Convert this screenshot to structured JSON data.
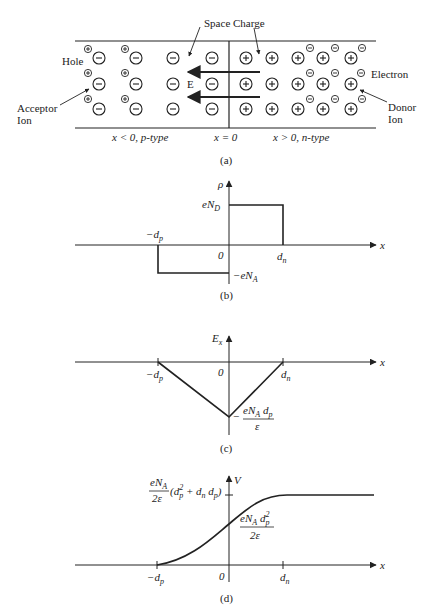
{
  "panel_a": {
    "annotations": {
      "space_charge": "Space Charge",
      "hole": "Hole",
      "electron": "Electron",
      "acceptor_ion": [
        "Acceptor",
        "Ion"
      ],
      "donor_ion": [
        "Donor",
        "Ion"
      ],
      "field": "E"
    },
    "region_labels": {
      "p_side": "x < 0, p-type",
      "junction": "x = 0",
      "n_side": "x > 0, n-type"
    },
    "caption": "(a)"
  },
  "panel_b": {
    "ylabel": "ρ",
    "xlabel": "x",
    "origin": "0",
    "left_tick": "−d",
    "left_tick_sub": "p",
    "right_tick": "d",
    "right_tick_sub": "n",
    "top_level": "eN",
    "top_level_sub": "D",
    "bottom_level": "−eN",
    "bottom_level_sub": "A",
    "caption": "(b)"
  },
  "panel_c": {
    "ylabel": "E",
    "ylabel_sub": "x",
    "xlabel": "x",
    "origin": "0",
    "left_tick": "−d",
    "left_tick_sub": "p",
    "right_tick": "d",
    "right_tick_sub": "n",
    "min_label_prefix": "−",
    "min_label_num": "eN",
    "min_label_num_sub": "A",
    "min_label_num_tail": " d",
    "min_label_num_tail_sub": "p",
    "min_label_den": "ε",
    "caption": "(c)"
  },
  "panel_d": {
    "ylabel": "V",
    "xlabel": "x",
    "origin": "0",
    "left_tick": "−d",
    "left_tick_sub": "p",
    "right_tick": "d",
    "right_tick_sub": "n",
    "top_num": "eN",
    "top_num_sub": "A",
    "top_den": "2ε",
    "top_paren": "(d",
    "top_paren_sub": "p",
    "top_paren_sup": "2",
    "top_paren_tail": " + d",
    "top_paren_tail_sub": "n",
    "top_paren_tail2": " d",
    "top_paren_tail2_sub": "p",
    "top_paren_close": ")",
    "mid_num": "eN",
    "mid_num_sub": "A",
    "mid_num_tail": " d",
    "mid_num_tail_sub": "p",
    "mid_num_tail_sup": "2",
    "mid_den": "2ε",
    "caption": "(d)"
  }
}
